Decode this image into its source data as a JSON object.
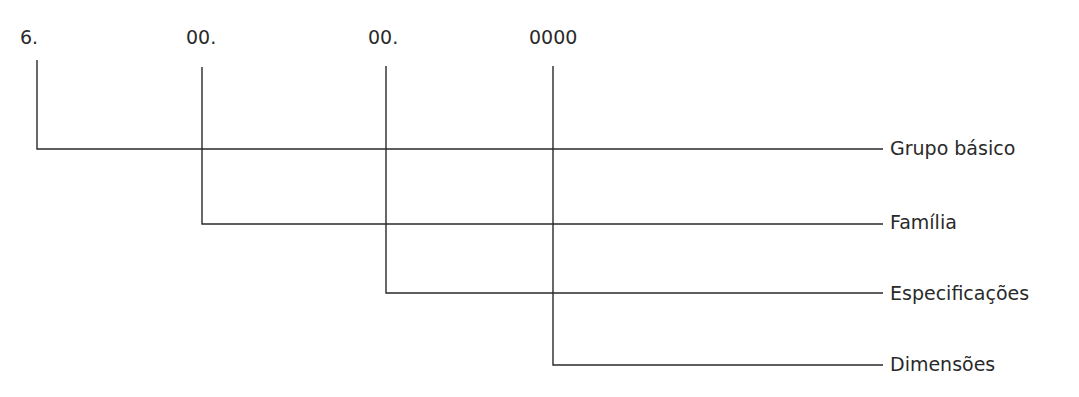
{
  "codes": [
    {
      "text": "6.",
      "x": 20
    },
    {
      "text": "00.",
      "x": 186
    },
    {
      "text": "00.",
      "x": 368
    },
    {
      "text": "0000",
      "x": 529
    }
  ],
  "labels": [
    {
      "text": "Grupo básico",
      "y": 137
    },
    {
      "text": "Família",
      "y": 211
    },
    {
      "text": "Especificações",
      "y": 282
    },
    {
      "text": "Dimensões",
      "y": 353
    }
  ],
  "line_color": "#2a2a2a"
}
